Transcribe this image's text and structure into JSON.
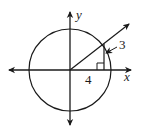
{
  "diagram": {
    "type": "unit-circle-angle",
    "colors": {
      "stroke": "#1a1a1a",
      "background": "#ffffff"
    },
    "axes": {
      "x_label": "x",
      "y_label": "y"
    },
    "triangle": {
      "adjacent_label": "4",
      "opposite_label": "3",
      "right_angle_marker": true
    },
    "circle": {
      "centered_at_origin": true
    },
    "terminal_ray": {
      "quadrant": "I",
      "has_arrow": true
    }
  }
}
